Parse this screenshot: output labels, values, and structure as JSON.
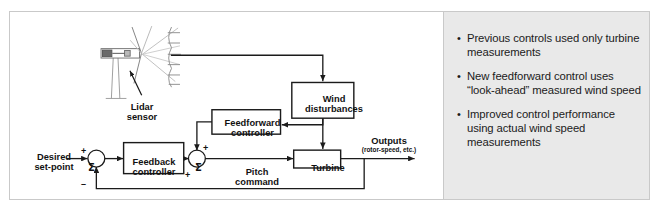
{
  "slide": {
    "width": 659,
    "height": 218,
    "background_color": "#ffffff",
    "border_color": "#c9c9c9"
  },
  "diagram": {
    "name": "wind-turbine-feedforward-control-block-diagram",
    "line_color": "#1b1b1b",
    "blocks": [
      {
        "id": "feedback_controller",
        "label": "Feedback\ncontroller",
        "x": 112,
        "y": 139,
        "w": 64,
        "h": 33
      },
      {
        "id": "feedforward_controller",
        "label": "Feedforward\ncontroller",
        "x": 206,
        "y": 104,
        "w": 73,
        "h": 26
      },
      {
        "id": "wind_disturbances",
        "label": "Wind\ndisturbances",
        "x": 291,
        "y": 75,
        "w": 66,
        "h": 38
      },
      {
        "id": "turbine",
        "label": "Turbine",
        "x": 293,
        "y": 147,
        "w": 50,
        "h": 19
      }
    ],
    "junctions": [
      {
        "id": "sum_1",
        "cx": 83,
        "cy": 156,
        "r": 9,
        "glyph": "Σ",
        "signs": [
          {
            "text": "+",
            "x": 71,
            "y": 135
          },
          {
            "text": "–",
            "x": 72,
            "y": 170
          }
        ]
      },
      {
        "id": "sum_2",
        "cx": 190,
        "cy": 156,
        "r": 9,
        "glyph": "Σ",
        "signs": [
          {
            "text": "+",
            "x": 193,
            "y": 133
          },
          {
            "text": "+",
            "x": 176,
            "y": 161
          }
        ]
      }
    ],
    "labels": [
      {
        "id": "desired_setpoint",
        "text": "Desired\nset-point",
        "x": 14,
        "y": 145
      },
      {
        "id": "lidar_sensor",
        "text": "Lidar\nsensor",
        "x": 111,
        "y": 94
      },
      {
        "id": "pitch_command",
        "text": "Pitch\ncommand",
        "x": 225,
        "y": 160
      },
      {
        "id": "outputs",
        "text": "Outputs",
        "x": 359,
        "y": 129
      },
      {
        "id": "outputs_sub",
        "text": "(rotor-speed, etc.)",
        "x": 341,
        "y": 138
      }
    ]
  },
  "bullets": {
    "panel_background": "#e9e9e9",
    "bullet_glyph": "•",
    "items": [
      "Previous controls used only turbine measurements",
      "New feedforward control uses “look-ahead” measured wind speed",
      "Improved control performance using actual wind speed measurements"
    ]
  }
}
